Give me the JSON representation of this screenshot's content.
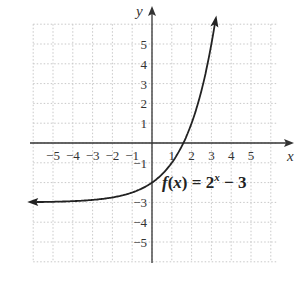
{
  "chart_data": {
    "type": "line",
    "title": "",
    "function_label": "f(x) = 2^x − 3",
    "xlabel": "x",
    "ylabel": "y",
    "xlim": [
      -6,
      6
    ],
    "ylim": [
      -6,
      6
    ],
    "grid": true,
    "x_ticks": [
      -5,
      -4,
      -3,
      -2,
      -1,
      1,
      2,
      3,
      4,
      5
    ],
    "y_ticks": [
      5,
      4,
      3,
      2,
      1,
      -1,
      -3,
      -4,
      -5
    ],
    "x_tick_labels": [
      "−5",
      "−4",
      "−3",
      "−2",
      "−1",
      "1",
      "2",
      "3",
      "4",
      "5"
    ],
    "y_tick_labels": [
      "5",
      "4",
      "3",
      "2",
      "1",
      "−1",
      "−3",
      "−4",
      "−5"
    ],
    "series": [
      {
        "name": "f(x) = 2^x - 3",
        "x": [
          -6,
          -5,
          -4,
          -3,
          -2,
          -1,
          0,
          1,
          1.585,
          2,
          2.5,
          3,
          3.2
        ],
        "y": [
          -2.98,
          -2.97,
          -2.94,
          -2.88,
          -2.75,
          -2.5,
          -2,
          -1,
          0,
          1,
          2.66,
          5,
          6.19
        ]
      }
    ],
    "horizontal_asymptote": -3
  },
  "labels": {
    "x_axis": "x",
    "y_axis": "y",
    "function_prefix": "f",
    "function_paren_open": "(",
    "function_var": "x",
    "function_paren_close": ")",
    "function_eq": " = 2",
    "function_exp": "x",
    "function_tail": " − 3"
  },
  "colors": {
    "axis": "#333333",
    "grid": "#c8c8c8",
    "curve": "#222222"
  }
}
